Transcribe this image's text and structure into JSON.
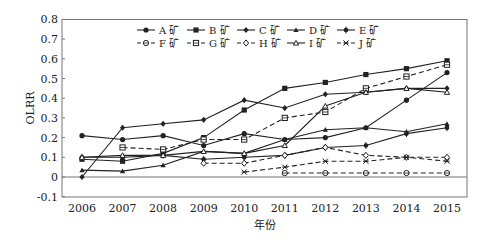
{
  "chart_data": {
    "type": "line",
    "title": "",
    "xlabel": "年份",
    "ylabel": "OLRR",
    "ylim": [
      -0.1,
      0.8
    ],
    "yticks": [
      "-0.1",
      "0",
      "0.1",
      "0.2",
      "0.3",
      "0.4",
      "0.5",
      "0.6",
      "0.7",
      "0.8"
    ],
    "categories": [
      "2006",
      "2007",
      "2008",
      "2009",
      "2010",
      "2011",
      "2012",
      "2013",
      "2014",
      "2015"
    ],
    "legend_position": "top-center-inside",
    "grid": false,
    "series": [
      {
        "name": "A 矿",
        "marker": "circle-filled",
        "dash": false,
        "values": [
          0.21,
          0.19,
          0.21,
          0.16,
          0.22,
          0.19,
          0.2,
          0.25,
          0.39,
          0.53
        ]
      },
      {
        "name": "B 矿",
        "marker": "square-filled",
        "dash": false,
        "values": [
          0.09,
          0.08,
          0.12,
          0.2,
          0.34,
          0.45,
          0.48,
          0.52,
          0.55,
          0.59
        ]
      },
      {
        "name": "C 矿",
        "marker": "diamond-filled",
        "dash": false,
        "values": [
          0.0,
          0.25,
          0.27,
          0.29,
          0.39,
          0.35,
          0.42,
          0.43,
          0.45,
          0.45
        ]
      },
      {
        "name": "D 矿",
        "marker": "triangle-filled",
        "dash": false,
        "values": [
          0.035,
          0.03,
          0.06,
          0.13,
          0.12,
          0.19,
          0.24,
          0.25,
          0.23,
          0.27
        ]
      },
      {
        "name": "E 矿",
        "marker": "star-filled",
        "dash": false,
        "values": [
          0.1,
          0.1,
          0.11,
          0.09,
          0.1,
          0.11,
          0.15,
          0.16,
          0.22,
          0.25
        ]
      },
      {
        "name": "F 矿",
        "marker": "circle-open",
        "dash": true,
        "values": [
          null,
          null,
          null,
          null,
          null,
          0.02,
          0.02,
          0.02,
          0.02,
          0.02
        ]
      },
      {
        "name": "G 矿",
        "marker": "square-open",
        "dash": true,
        "values": [
          null,
          0.15,
          0.14,
          0.19,
          0.19,
          0.3,
          0.33,
          0.45,
          0.51,
          0.57
        ]
      },
      {
        "name": "H 矿",
        "marker": "diamond-open",
        "dash": true,
        "values": [
          null,
          null,
          null,
          0.07,
          0.07,
          0.11,
          0.15,
          0.11,
          0.1,
          0.1
        ]
      },
      {
        "name": "I 矿",
        "marker": "triangle-open",
        "dash": false,
        "values": [
          0.1,
          0.11,
          0.11,
          0.13,
          0.12,
          0.16,
          0.36,
          0.43,
          0.45,
          0.43
        ]
      },
      {
        "name": "J 矿",
        "marker": "x-cross",
        "dash": true,
        "values": [
          null,
          null,
          null,
          null,
          0.025,
          0.05,
          0.08,
          0.08,
          0.1,
          0.08
        ]
      }
    ]
  },
  "axes": {
    "xlabel": "年份",
    "ylabel": "OLRR"
  }
}
